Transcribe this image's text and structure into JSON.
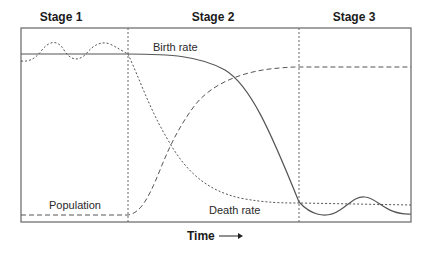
{
  "diagram": {
    "stages": [
      {
        "label": "Stage 1"
      },
      {
        "label": "Stage 2"
      },
      {
        "label": "Stage 3"
      }
    ],
    "curves": {
      "birth_rate": {
        "label": "Birth rate",
        "style": "solid"
      },
      "death_rate": {
        "label": "Death rate",
        "style": "dotted"
      },
      "population": {
        "label": "Population",
        "style": "dashed"
      }
    },
    "x_axis": {
      "label": "Time",
      "arrow": "→"
    },
    "colors": {
      "line": "#555555",
      "frame": "#666666",
      "text": "#1a1a1a"
    }
  }
}
